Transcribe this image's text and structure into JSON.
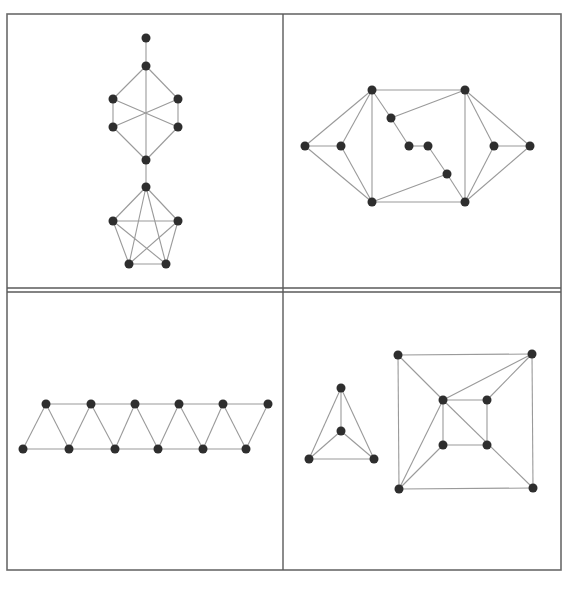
{
  "figure": {
    "layout": "2x2 grid of graph drawings",
    "colors": {
      "frame": "#6a6a6a",
      "edge": "#9a9a9a",
      "node": "#2e2e2e",
      "background": "#ffffff"
    },
    "frame": {
      "x1": 7,
      "y1": 14,
      "x2": 561,
      "y2": 570
    },
    "dividers": [
      {
        "x1": 283,
        "y1": 14,
        "x2": 283,
        "y2": 570
      },
      {
        "x1": 7,
        "y1": 288,
        "x2": 561,
        "y2": 288
      },
      {
        "x1": 7,
        "y1": 292,
        "x2": 561,
        "y2": 292
      }
    ],
    "node_radius": 4.5
  },
  "panels": [
    {
      "id": "top-left",
      "description": "pendant vertex, K3,3-like hexagon with crossing diagonals, bridge to K5",
      "nodes": [
        [
          146,
          38
        ],
        [
          146,
          66
        ],
        [
          113,
          99
        ],
        [
          178,
          99
        ],
        [
          113,
          127
        ],
        [
          178,
          127
        ],
        [
          146,
          160
        ],
        [
          146,
          187
        ],
        [
          113,
          221
        ],
        [
          178,
          221
        ],
        [
          129,
          264
        ],
        [
          166,
          264
        ]
      ],
      "edges": [
        [
          0,
          1
        ],
        [
          1,
          2
        ],
        [
          1,
          3
        ],
        [
          1,
          6
        ],
        [
          2,
          4
        ],
        [
          3,
          5
        ],
        [
          2,
          5
        ],
        [
          3,
          4
        ],
        [
          4,
          6
        ],
        [
          5,
          6
        ],
        [
          6,
          7
        ],
        [
          7,
          8
        ],
        [
          7,
          9
        ],
        [
          7,
          10
        ],
        [
          7,
          11
        ],
        [
          8,
          9
        ],
        [
          8,
          10
        ],
        [
          8,
          11
        ],
        [
          9,
          10
        ],
        [
          9,
          11
        ],
        [
          10,
          11
        ]
      ]
    },
    {
      "id": "top-right",
      "description": "symmetric graph with left and right fans and inner zigzag path",
      "nodes": [
        [
          305,
          146
        ],
        [
          341,
          146
        ],
        [
          372,
          90
        ],
        [
          372,
          202
        ],
        [
          465,
          90
        ],
        [
          465,
          202
        ],
        [
          391,
          118
        ],
        [
          409,
          146
        ],
        [
          428,
          146
        ],
        [
          447,
          174
        ],
        [
          494,
          146
        ],
        [
          530,
          146
        ]
      ],
      "edges": [
        [
          0,
          1
        ],
        [
          0,
          2
        ],
        [
          0,
          3
        ],
        [
          1,
          2
        ],
        [
          1,
          3
        ],
        [
          2,
          3
        ],
        [
          2,
          4
        ],
        [
          2,
          6
        ],
        [
          6,
          4
        ],
        [
          6,
          7
        ],
        [
          7,
          8
        ],
        [
          8,
          9
        ],
        [
          9,
          5
        ],
        [
          9,
          3
        ],
        [
          3,
          5
        ],
        [
          4,
          5
        ],
        [
          4,
          10
        ],
        [
          4,
          11
        ],
        [
          5,
          10
        ],
        [
          5,
          11
        ],
        [
          10,
          11
        ]
      ]
    },
    {
      "id": "bottom-left",
      "description": "triangular strip (zigzag ladder) of 12 vertices",
      "nodes": [
        [
          46,
          404
        ],
        [
          91,
          404
        ],
        [
          135,
          404
        ],
        [
          179,
          404
        ],
        [
          223,
          404
        ],
        [
          268,
          404
        ],
        [
          23,
          449
        ],
        [
          69,
          449
        ],
        [
          115,
          449
        ],
        [
          158,
          449
        ],
        [
          203,
          449
        ],
        [
          246,
          449
        ]
      ],
      "edges": [
        [
          0,
          1
        ],
        [
          1,
          2
        ],
        [
          2,
          3
        ],
        [
          3,
          4
        ],
        [
          4,
          5
        ],
        [
          6,
          7
        ],
        [
          7,
          8
        ],
        [
          8,
          9
        ],
        [
          9,
          10
        ],
        [
          10,
          11
        ],
        [
          6,
          0
        ],
        [
          0,
          7
        ],
        [
          7,
          1
        ],
        [
          1,
          8
        ],
        [
          8,
          2
        ],
        [
          2,
          9
        ],
        [
          9,
          3
        ],
        [
          3,
          10
        ],
        [
          10,
          4
        ],
        [
          4,
          11
        ],
        [
          11,
          5
        ]
      ]
    },
    {
      "id": "bottom-right",
      "description": "K4 drawn as triangle with center vertex, and nested squares with diagonals",
      "nodes": [
        [
          341,
          388
        ],
        [
          341,
          431
        ],
        [
          309,
          459
        ],
        [
          374,
          459
        ],
        [
          398,
          355
        ],
        [
          532,
          354
        ],
        [
          399,
          489
        ],
        [
          533,
          488
        ],
        [
          443,
          400
        ],
        [
          487,
          400
        ],
        [
          443,
          445
        ],
        [
          487,
          445
        ]
      ],
      "edges": [
        [
          0,
          1
        ],
        [
          0,
          2
        ],
        [
          0,
          3
        ],
        [
          1,
          2
        ],
        [
          1,
          3
        ],
        [
          2,
          3
        ],
        [
          4,
          5
        ],
        [
          5,
          7
        ],
        [
          7,
          6
        ],
        [
          6,
          4
        ],
        [
          4,
          8
        ],
        [
          8,
          7
        ],
        [
          5,
          8
        ],
        [
          5,
          9
        ],
        [
          6,
          8
        ],
        [
          6,
          10
        ],
        [
          8,
          9
        ],
        [
          9,
          11
        ],
        [
          11,
          10
        ],
        [
          10,
          8
        ]
      ]
    }
  ]
}
